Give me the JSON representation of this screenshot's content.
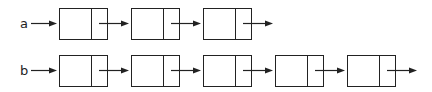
{
  "diagram": {
    "type": "linked-lists",
    "lists": [
      {
        "name": "a",
        "node_count": 3,
        "y": 8
      },
      {
        "name": "b",
        "node_count": 5,
        "y": 55
      }
    ],
    "layout": {
      "box_start_x": 59,
      "box_spacing": 72,
      "box_width": 48,
      "box_height": 31,
      "divider_offset": 32
    },
    "colors": {
      "stroke": "#222222",
      "background": "#ffffff"
    }
  }
}
